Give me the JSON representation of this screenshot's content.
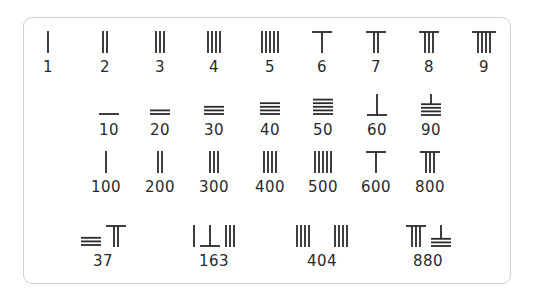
{
  "colors": {
    "stroke": "#2a2a2a",
    "border": "#cfcfcf"
  },
  "rows": [
    {
      "name": "units",
      "items": [
        {
          "label": "1",
          "x": 48,
          "parts": [
            {
              "orient": "v",
              "n": 1
            }
          ]
        },
        {
          "label": "2",
          "x": 105,
          "parts": [
            {
              "orient": "v",
              "n": 2
            }
          ]
        },
        {
          "label": "3",
          "x": 160,
          "parts": [
            {
              "orient": "v",
              "n": 3
            }
          ]
        },
        {
          "label": "4",
          "x": 214,
          "parts": [
            {
              "orient": "v",
              "n": 4
            }
          ]
        },
        {
          "label": "5",
          "x": 270,
          "parts": [
            {
              "orient": "v",
              "n": 5
            }
          ]
        },
        {
          "label": "6",
          "x": 322,
          "parts": [
            {
              "orient": "v",
              "n": 6
            }
          ]
        },
        {
          "label": "7",
          "x": 376,
          "parts": [
            {
              "orient": "v",
              "n": 7
            }
          ]
        },
        {
          "label": "8",
          "x": 429,
          "parts": [
            {
              "orient": "v",
              "n": 8
            }
          ]
        },
        {
          "label": "9",
          "x": 484,
          "parts": [
            {
              "orient": "v",
              "n": 9
            }
          ]
        }
      ]
    },
    {
      "name": "tens",
      "items": [
        {
          "label": "10",
          "x": 109,
          "parts": [
            {
              "orient": "h",
              "n": 1
            }
          ]
        },
        {
          "label": "20",
          "x": 160,
          "parts": [
            {
              "orient": "h",
              "n": 2
            }
          ]
        },
        {
          "label": "30",
          "x": 214,
          "parts": [
            {
              "orient": "h",
              "n": 3
            }
          ]
        },
        {
          "label": "40",
          "x": 270,
          "parts": [
            {
              "orient": "h",
              "n": 4
            }
          ]
        },
        {
          "label": "50",
          "x": 323,
          "parts": [
            {
              "orient": "h",
              "n": 5
            }
          ]
        },
        {
          "label": "60",
          "x": 377,
          "parts": [
            {
              "orient": "h",
              "n": 6
            }
          ]
        },
        {
          "label": "90",
          "x": 431,
          "parts": [
            {
              "orient": "h",
              "n": 9
            }
          ]
        }
      ]
    },
    {
      "name": "hundreds",
      "items": [
        {
          "label": "100",
          "x": 106,
          "parts": [
            {
              "orient": "v",
              "n": 1
            }
          ]
        },
        {
          "label": "200",
          "x": 160,
          "parts": [
            {
              "orient": "v",
              "n": 2
            }
          ]
        },
        {
          "label": "300",
          "x": 214,
          "parts": [
            {
              "orient": "v",
              "n": 3
            }
          ]
        },
        {
          "label": "400",
          "x": 270,
          "parts": [
            {
              "orient": "v",
              "n": 4
            }
          ]
        },
        {
          "label": "500",
          "x": 323,
          "parts": [
            {
              "orient": "v",
              "n": 5
            }
          ]
        },
        {
          "label": "600",
          "x": 376,
          "parts": [
            {
              "orient": "v",
              "n": 6
            }
          ]
        },
        {
          "label": "800",
          "x": 430,
          "parts": [
            {
              "orient": "v",
              "n": 8
            }
          ]
        }
      ]
    },
    {
      "name": "examples",
      "items": [
        {
          "label": "37",
          "x": 103,
          "parts": [
            {
              "orient": "h",
              "n": 3
            },
            {
              "orient": "v",
              "n": 7
            }
          ]
        },
        {
          "label": "163",
          "x": 214,
          "parts": [
            {
              "orient": "v",
              "n": 1
            },
            {
              "orient": "h",
              "n": 6
            },
            {
              "orient": "v",
              "n": 3
            }
          ]
        },
        {
          "label": "404",
          "x": 322,
          "parts": [
            {
              "orient": "v",
              "n": 4
            },
            {
              "orient": "blank",
              "n": 0
            },
            {
              "orient": "v",
              "n": 4
            }
          ]
        },
        {
          "label": "880",
          "x": 428,
          "parts": [
            {
              "orient": "v",
              "n": 8
            },
            {
              "orient": "h",
              "n": 8
            }
          ]
        }
      ]
    }
  ]
}
